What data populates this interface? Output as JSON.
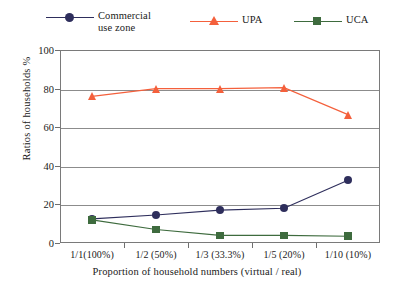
{
  "chart_data": {
    "type": "line",
    "title": "",
    "xlabel": "Proportion of household numbers (virtual / real)",
    "ylabel": "Ratios of households %",
    "categories": [
      "1/1(100%)",
      "1/2 (50%)",
      "1/3 (33.3%)",
      "1/5 (20%)",
      "1/10 (10%)"
    ],
    "ylim": [
      0,
      100
    ],
    "yticks": [
      0,
      20,
      40,
      60,
      80,
      100
    ],
    "grid": true,
    "legend_position": "top",
    "series": [
      {
        "name": "Commercial\nuse zone",
        "marker": "circle",
        "color": "#2e2e5c",
        "values": [
          12.5,
          14.5,
          17,
          18,
          32.5
        ]
      },
      {
        "name": "UPA",
        "marker": "triangle",
        "color": "#f4603c",
        "values": [
          76,
          80,
          80,
          80.5,
          66.5
        ]
      },
      {
        "name": "UCA",
        "marker": "square",
        "color": "#3e6b3e",
        "values": [
          12,
          7,
          4,
          4,
          3.5
        ]
      }
    ]
  },
  "legend": {
    "items": [
      {
        "label": "Commercial\nuse zone",
        "icon": "circle-marker-icon"
      },
      {
        "label": "UPA",
        "icon": "triangle-marker-icon"
      },
      {
        "label": "UCA",
        "icon": "square-marker-icon"
      }
    ]
  },
  "axes": {
    "y_title": "Ratios of households %",
    "x_title": "Proportion of household numbers (virtual / real)",
    "y_tick_labels": [
      "100",
      "80",
      "60",
      "40",
      "20",
      "0"
    ],
    "x_tick_labels": [
      "1/1(100%)",
      "1/2 (50%)",
      "1/3 (33.3%)",
      "1/5 (20%)",
      "1/10 (10%)"
    ]
  },
  "colors": {
    "commercial": "#2e2e5c",
    "upa": "#f4603c",
    "uca": "#3e6b3e",
    "frame": "#7a7a7a",
    "grid": "#8c8c8c",
    "text": "#1a1a1a"
  }
}
